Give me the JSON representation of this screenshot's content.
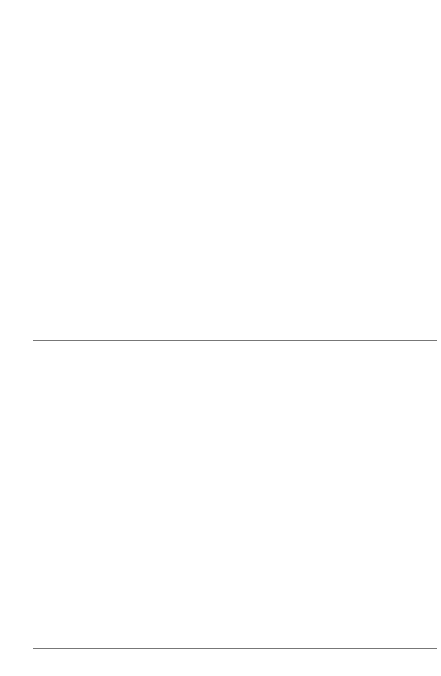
{
  "figure": {
    "background": "#ffffff"
  },
  "legend": {
    "position": "top-center",
    "items": [
      {
        "label": "초등학교 졸업",
        "color": "#4d4d4d",
        "key": "elementary"
      },
      {
        "label": "중학교 졸업",
        "color": "#b0b0b0",
        "key": "middle"
      },
      {
        "label": "고등학교 졸업",
        "color": "#7a7a7a",
        "key": "high"
      },
      {
        "label": "대졸 이상",
        "color": "#dcdcdc",
        "key": "college"
      }
    ]
  },
  "chart_data": [
    {
      "id": "counts",
      "type": "bar",
      "stacked": true,
      "title": "",
      "xlabel": "",
      "ylabel": "",
      "ylim": [
        0,
        800000
      ],
      "grid": true,
      "ytick_labels": [
        "0",
        "20만 명",
        "40만 명",
        "60만 명",
        "80만 명"
      ],
      "ytick_values": [
        0,
        200000,
        400000,
        600000,
        800000
      ],
      "categories": [
        "자산5 : 소득5",
        "자산5 : 소득4",
        "자산5 : 소득3",
        "자산5 : 소득2",
        "자산5 : 소득1",
        "자산4 : 소득5",
        "자산4 : 소득4",
        "자산4 : 소득3",
        "자산4 : 소득2",
        "자산4 : 소득1",
        "자산3 : 소득5",
        "자산3 : 소득4",
        "자산3 : 소득3",
        "자산3 : 소득2",
        "자산3 : 소득1",
        "자산2 : 소득5",
        "자산2 : 소득4",
        "자산2 : 소득3",
        "자산2 : 소득2",
        "자산2 : 소득1",
        "자산1 : 소득5",
        "자산1 : 소득4",
        "자산1 : 소득3",
        "자산1 : 소득2",
        "자산1 : 소득1"
      ],
      "group_size": 5,
      "series": [
        {
          "name": "초등학교 졸업",
          "color": "#4d4d4d",
          "values": [
            18000,
            22000,
            26000,
            30000,
            34000,
            22000,
            30000,
            40000,
            46000,
            52000,
            30000,
            44000,
            56000,
            62000,
            70000,
            36000,
            60000,
            80000,
            92000,
            104000,
            48000,
            82000,
            110000,
            132000,
            152000
          ]
        },
        {
          "name": "중학교 졸업",
          "color": "#b0b0b0",
          "values": [
            6000,
            8000,
            10000,
            12000,
            14000,
            8000,
            12000,
            16000,
            20000,
            22000,
            10000,
            16000,
            22000,
            26000,
            30000,
            12000,
            20000,
            28000,
            34000,
            38000,
            14000,
            22000,
            32000,
            38000,
            42000
          ]
        },
        {
          "name": "고등학교 졸업",
          "color": "#7a7a7a",
          "values": [
            196000,
            112000,
            78000,
            60000,
            44000,
            150000,
            118000,
            92000,
            74000,
            58000,
            120000,
            100000,
            84000,
            70000,
            56000,
            96000,
            84000,
            72000,
            62000,
            50000,
            72000,
            64000,
            56000,
            50000,
            44000
          ]
        },
        {
          "name": "대졸 이상",
          "color": "#dcdcdc",
          "values": [
            560000,
            128000,
            70000,
            40000,
            24000,
            152000,
            96000,
            60000,
            38000,
            22000,
            92000,
            64000,
            44000,
            28000,
            18000,
            60000,
            44000,
            30000,
            20000,
            14000,
            34000,
            26000,
            18000,
            14000,
            10000
          ]
        }
      ]
    },
    {
      "id": "shares",
      "type": "bar",
      "stacked": true,
      "normalized": true,
      "title": "",
      "xlabel": "",
      "ylabel": "",
      "ylim": [
        0,
        100
      ],
      "grid": false,
      "ytick_labels": [
        "0%",
        "25%",
        "50%",
        "75%",
        "100%"
      ],
      "ytick_values": [
        0,
        25,
        50,
        75,
        100
      ],
      "categories": [
        "자산5 : 소득5",
        "자산5 : 소득4",
        "자산5 : 소득3",
        "자산5 : 소득2",
        "자산5 : 소득1",
        "자산4 : 소득5",
        "자산4 : 소득4",
        "자산4 : 소득3",
        "자산4 : 소득2",
        "자산4 : 소득1",
        "자산3 : 소득5",
        "자산3 : 소득4",
        "자산3 : 소득3",
        "자산3 : 소득2",
        "자산3 : 소득1",
        "자산2 : 소득5",
        "자산2 : 소득4",
        "자산2 : 소득3",
        "자산2 : 소득2",
        "자산2 : 소득1",
        "자산1 : 소득5",
        "자산1 : 소득4",
        "자산1 : 소득3",
        "자산1 : 소득2",
        "자산1 : 소득1"
      ],
      "series": [
        {
          "name": "초등학교 졸업",
          "color": "#4d4d4d",
          "values": [
            2,
            4,
            6,
            8,
            11,
            4,
            7,
            9,
            12,
            15,
            7,
            11,
            15,
            19,
            23,
            10,
            15,
            21,
            26,
            31,
            15,
            21,
            27,
            32,
            38
          ]
        },
        {
          "name": "중학교 졸업",
          "color": "#b0b0b0",
          "values": [
            2,
            3,
            4,
            5,
            6,
            3,
            4,
            5,
            6,
            7,
            4,
            5,
            6,
            7,
            8,
            5,
            6,
            7,
            8,
            9,
            6,
            7,
            8,
            9,
            10
          ]
        },
        {
          "name": "고등학교 졸업",
          "color": "#7a7a7a",
          "values": [
            25,
            40,
            47,
            52,
            57,
            40,
            47,
            52,
            57,
            62,
            47,
            52,
            57,
            59,
            60,
            52,
            56,
            58,
            59,
            59,
            56,
            57,
            57,
            57,
            56
          ]
        },
        {
          "name": "대졸 이상",
          "color": "#dcdcdc",
          "values": [
            71,
            53,
            43,
            35,
            26,
            53,
            42,
            34,
            25,
            16,
            42,
            32,
            22,
            15,
            9,
            33,
            23,
            14,
            7,
            1,
            23,
            15,
            8,
            2,
            0
          ]
        }
      ]
    }
  ]
}
